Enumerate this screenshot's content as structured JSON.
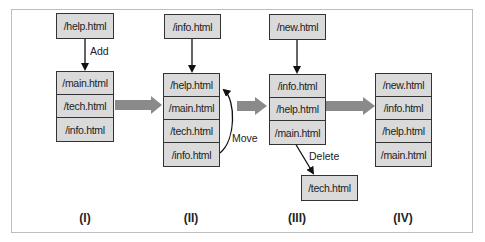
{
  "stages": [
    {
      "label": "(I)",
      "incoming": "/help.html",
      "action": "Add",
      "stack": [
        "/main.html",
        "/tech.html",
        "/info.html"
      ]
    },
    {
      "label": "(II)",
      "incoming": "/info.html",
      "action": "Move",
      "stack": [
        "/help.html",
        "/main.html",
        "/tech.html",
        "/info.html"
      ]
    },
    {
      "label": "(III)",
      "incoming": "/new.html",
      "action": "Delete",
      "stack": [
        "/info.html",
        "/help.html",
        "/main.html"
      ],
      "removed": "/tech.html"
    },
    {
      "label": "(IV)",
      "stack": [
        "/new.html",
        "/info.html",
        "/help.html",
        "/main.html"
      ]
    }
  ],
  "colors": {
    "box_fill": "#dadada",
    "border": "#333333",
    "transition_arrow": "#8a8a8a",
    "frame": "#bdbdbd"
  }
}
